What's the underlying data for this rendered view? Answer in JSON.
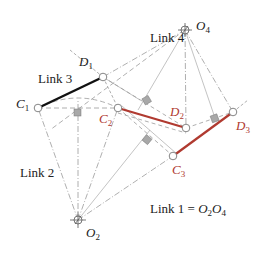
{
  "diagram": {
    "labels": {
      "link1": "Link 1 = ",
      "link1_o2": "O",
      "link1_o2_sub": "2",
      "link1_o4": "O",
      "link1_o4_sub": "4",
      "link2": "Link 2",
      "link3": "Link 3",
      "link4": "Link 4"
    },
    "points": {
      "O2": {
        "letter": "O",
        "sub": "2",
        "x": 78,
        "y": 220
      },
      "O4": {
        "letter": "O",
        "sub": "4",
        "x": 185,
        "y": 30
      },
      "C1": {
        "letter": "C",
        "sub": "1",
        "x": 38,
        "y": 108
      },
      "D1": {
        "letter": "D",
        "sub": "1",
        "x": 103,
        "y": 77
      },
      "C2": {
        "letter": "C",
        "sub": "2",
        "x": 118,
        "y": 108
      },
      "D2": {
        "letter": "D",
        "sub": "2",
        "x": 186,
        "y": 128
      },
      "C3": {
        "letter": "C",
        "sub": "3",
        "x": 173,
        "y": 156
      },
      "D3": {
        "letter": "D",
        "sub": "3",
        "x": 233,
        "y": 112
      }
    },
    "colors": {
      "link3_position1": "#111111",
      "link3_positions23": "#b03a30",
      "construction": "#9a9a9a",
      "right_angle_fill": "#a8a8a8",
      "subscript_red": "#b03a30"
    }
  }
}
